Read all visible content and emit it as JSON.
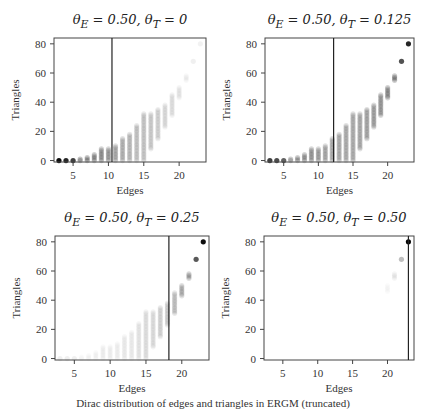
{
  "figure": {
    "caption": "Dirac distribution of edges and triangles in ERGM (truncated)"
  },
  "chart_data": [
    {
      "type": "scatter",
      "title": "θ_E = 0.50, θ_T = 0",
      "xlabel": "Edges",
      "ylabel": "Triangles",
      "xticks": [
        5,
        10,
        15,
        20
      ],
      "yticks": [
        0,
        20,
        40,
        60,
        80
      ],
      "xlim": [
        2.3,
        23.8
      ],
      "ylim": [
        -1,
        84
      ],
      "vline": 10.5,
      "grid": false,
      "columns": [
        {
          "x": 3,
          "ymin": 0,
          "ymax": 0,
          "shade": 0.95
        },
        {
          "x": 4,
          "ymin": 0,
          "ymax": 0,
          "shade": 0.85
        },
        {
          "x": 5,
          "ymin": 0,
          "ymax": 0,
          "shade": 0.75
        },
        {
          "x": 6,
          "ymin": 0,
          "ymax": 1,
          "shade": 0.65
        },
        {
          "x": 7,
          "ymin": 0,
          "ymax": 2,
          "shade": 0.58
        },
        {
          "x": 8,
          "ymin": 0,
          "ymax": 4,
          "shade": 0.5
        },
        {
          "x": 9,
          "ymin": 0,
          "ymax": 8,
          "shade": 0.45
        },
        {
          "x": 10,
          "ymin": 0,
          "ymax": 8,
          "shade": 0.4
        },
        {
          "x": 11,
          "ymin": 0,
          "ymax": 10,
          "shade": 0.35
        },
        {
          "x": 12,
          "ymin": 0,
          "ymax": 15,
          "shade": 0.3
        },
        {
          "x": 13,
          "ymin": 0,
          "ymax": 18,
          "shade": 0.27
        },
        {
          "x": 14,
          "ymin": 0,
          "ymax": 24,
          "shade": 0.24
        },
        {
          "x": 15,
          "ymin": 0,
          "ymax": 32,
          "shade": 0.22
        },
        {
          "x": 16,
          "ymin": 8,
          "ymax": 32,
          "shade": 0.2
        },
        {
          "x": 17,
          "ymin": 15,
          "ymax": 35,
          "shade": 0.18
        },
        {
          "x": 18,
          "ymin": 23,
          "ymax": 38,
          "shade": 0.15
        },
        {
          "x": 19,
          "ymin": 31,
          "ymax": 45,
          "shade": 0.12
        },
        {
          "x": 20,
          "ymin": 43,
          "ymax": 50,
          "shade": 0.1
        },
        {
          "x": 21,
          "ymin": 55,
          "ymax": 58,
          "shade": 0.08
        },
        {
          "x": 22,
          "ymin": 68,
          "ymax": 68,
          "shade": 0.06
        },
        {
          "x": 23,
          "ymin": 80,
          "ymax": 80,
          "shade": 0.05
        }
      ]
    },
    {
      "type": "scatter",
      "title": "θ_E = 0.50, θ_T = 0.125",
      "xlabel": "Edges",
      "ylabel": "Triangles",
      "xticks": [
        5,
        10,
        15,
        20
      ],
      "yticks": [
        0,
        20,
        40,
        60,
        80
      ],
      "xlim": [
        2.3,
        23.8
      ],
      "ylim": [
        -1,
        84
      ],
      "vline": 12.2,
      "grid": false,
      "columns": [
        {
          "x": 3,
          "ymin": 0,
          "ymax": 0,
          "shade": 0.75
        },
        {
          "x": 4,
          "ymin": 0,
          "ymax": 0,
          "shade": 0.7
        },
        {
          "x": 5,
          "ymin": 0,
          "ymax": 0,
          "shade": 0.62
        },
        {
          "x": 6,
          "ymin": 0,
          "ymax": 1,
          "shade": 0.55
        },
        {
          "x": 7,
          "ymin": 0,
          "ymax": 2,
          "shade": 0.5
        },
        {
          "x": 8,
          "ymin": 0,
          "ymax": 4,
          "shade": 0.45
        },
        {
          "x": 9,
          "ymin": 0,
          "ymax": 8,
          "shade": 0.42
        },
        {
          "x": 10,
          "ymin": 0,
          "ymax": 8,
          "shade": 0.38
        },
        {
          "x": 11,
          "ymin": 0,
          "ymax": 10,
          "shade": 0.35
        },
        {
          "x": 12,
          "ymin": 0,
          "ymax": 15,
          "shade": 0.33
        },
        {
          "x": 13,
          "ymin": 0,
          "ymax": 18,
          "shade": 0.32
        },
        {
          "x": 14,
          "ymin": 0,
          "ymax": 24,
          "shade": 0.32
        },
        {
          "x": 15,
          "ymin": 0,
          "ymax": 32,
          "shade": 0.33
        },
        {
          "x": 16,
          "ymin": 8,
          "ymax": 32,
          "shade": 0.34
        },
        {
          "x": 17,
          "ymin": 15,
          "ymax": 35,
          "shade": 0.36
        },
        {
          "x": 18,
          "ymin": 23,
          "ymax": 38,
          "shade": 0.38
        },
        {
          "x": 19,
          "ymin": 31,
          "ymax": 45,
          "shade": 0.42
        },
        {
          "x": 20,
          "ymin": 43,
          "ymax": 50,
          "shade": 0.48
        },
        {
          "x": 21,
          "ymin": 55,
          "ymax": 58,
          "shade": 0.55
        },
        {
          "x": 22,
          "ymin": 68,
          "ymax": 68,
          "shade": 0.68
        },
        {
          "x": 23,
          "ymin": 80,
          "ymax": 80,
          "shade": 0.85
        }
      ]
    },
    {
      "type": "scatter",
      "title": "θ_E = 0.50, θ_T = 0.25",
      "xlabel": "Edges",
      "ylabel": "Triangles",
      "xticks": [
        5,
        10,
        15,
        20
      ],
      "yticks": [
        0,
        20,
        40,
        60,
        80
      ],
      "xlim": [
        2.3,
        23.8
      ],
      "ylim": [
        -1,
        84
      ],
      "vline": 18.2,
      "grid": false,
      "columns": [
        {
          "x": 3,
          "ymin": 0,
          "ymax": 0,
          "shade": 0.06
        },
        {
          "x": 4,
          "ymin": 0,
          "ymax": 0,
          "shade": 0.06
        },
        {
          "x": 5,
          "ymin": 0,
          "ymax": 0,
          "shade": 0.06
        },
        {
          "x": 6,
          "ymin": 0,
          "ymax": 1,
          "shade": 0.06
        },
        {
          "x": 7,
          "ymin": 0,
          "ymax": 2,
          "shade": 0.06
        },
        {
          "x": 8,
          "ymin": 0,
          "ymax": 4,
          "shade": 0.06
        },
        {
          "x": 9,
          "ymin": 0,
          "ymax": 8,
          "shade": 0.07
        },
        {
          "x": 10,
          "ymin": 0,
          "ymax": 8,
          "shade": 0.07
        },
        {
          "x": 11,
          "ymin": 0,
          "ymax": 10,
          "shade": 0.07
        },
        {
          "x": 12,
          "ymin": 0,
          "ymax": 15,
          "shade": 0.08
        },
        {
          "x": 13,
          "ymin": 0,
          "ymax": 18,
          "shade": 0.08
        },
        {
          "x": 14,
          "ymin": 0,
          "ymax": 24,
          "shade": 0.1
        },
        {
          "x": 15,
          "ymin": 0,
          "ymax": 32,
          "shade": 0.12
        },
        {
          "x": 16,
          "ymin": 8,
          "ymax": 32,
          "shade": 0.14
        },
        {
          "x": 17,
          "ymin": 15,
          "ymax": 35,
          "shade": 0.17
        },
        {
          "x": 18,
          "ymin": 23,
          "ymax": 38,
          "shade": 0.2
        },
        {
          "x": 19,
          "ymin": 31,
          "ymax": 45,
          "shade": 0.25
        },
        {
          "x": 20,
          "ymin": 43,
          "ymax": 50,
          "shade": 0.32
        },
        {
          "x": 21,
          "ymin": 55,
          "ymax": 58,
          "shade": 0.42
        },
        {
          "x": 22,
          "ymin": 68,
          "ymax": 68,
          "shade": 0.65
        },
        {
          "x": 23,
          "ymin": 80,
          "ymax": 80,
          "shade": 0.95
        }
      ]
    },
    {
      "type": "scatter",
      "title": "θ_E = 0.50, θ_T = 0.50",
      "xlabel": "Edges",
      "ylabel": "Triangles",
      "xticks": [
        5,
        10,
        15,
        20
      ],
      "yticks": [
        0,
        20,
        40,
        60,
        80
      ],
      "xlim": [
        2.3,
        23.8
      ],
      "ylim": [
        -1,
        84
      ],
      "vline": 23.0,
      "grid": false,
      "columns": [
        {
          "x": 20,
          "ymin": 46,
          "ymax": 50,
          "shade": 0.04
        },
        {
          "x": 21,
          "ymin": 55,
          "ymax": 58,
          "shade": 0.1
        },
        {
          "x": 22,
          "ymin": 68,
          "ymax": 68,
          "shade": 0.25
        },
        {
          "x": 23,
          "ymin": 80,
          "ymax": 80,
          "shade": 0.98
        }
      ]
    }
  ],
  "panels": [
    {
      "title_main": "θ",
      "title_html": "θ<sub>E</sub> = 0.50, θ<sub>T</sub> = 0"
    },
    {
      "title_html": "θ<sub>E</sub> = 0.50, θ<sub>T</sub> = 0.125"
    },
    {
      "title_html": "θ<sub>E</sub> = 0.50, θ<sub>T</sub> = 0.25"
    },
    {
      "title_html": "θ<sub>E</sub> = 0.50, θ<sub>T</sub> = 0.50"
    }
  ]
}
